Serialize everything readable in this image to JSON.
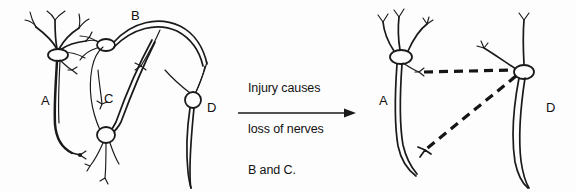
{
  "figure": {
    "title": "Injury causes loss of nerves B and C",
    "background_color": "#fdfdfd",
    "ink_color": "#1a1a1a"
  },
  "caption": {
    "line1": "Injury causes",
    "line2": "loss of nerves",
    "line3": "B and C."
  },
  "transition_arrow": {
    "direction": "right",
    "label": "transition-arrow"
  },
  "panels": [
    {
      "id": "before",
      "name": "intact-circuit",
      "neurons": [
        {
          "id": "A",
          "label": "A",
          "state": "intact"
        },
        {
          "id": "B",
          "label": "B",
          "state": "intact"
        },
        {
          "id": "C",
          "label": "C",
          "state": "intact"
        },
        {
          "id": "D",
          "label": "D",
          "state": "intact"
        }
      ]
    },
    {
      "id": "after",
      "name": "injured-circuit",
      "neurons": [
        {
          "id": "A",
          "label": "A",
          "state": "intact"
        },
        {
          "id": "D",
          "label": "D",
          "state": "intact"
        }
      ],
      "lost_neurons": [
        {
          "id": "B",
          "label": "B",
          "state": "lost"
        },
        {
          "id": "C",
          "label": "C",
          "state": "lost"
        }
      ],
      "dashed_paths": [
        {
          "name": "lost-nerve-path-upper",
          "from": "A",
          "to": "D"
        },
        {
          "name": "lost-nerve-path-lower",
          "from": "D",
          "to": "A-axon-terminal"
        }
      ]
    }
  ],
  "labels": {
    "left_A": "A",
    "left_B": "B",
    "left_C": "C",
    "left_D": "D",
    "right_A": "A",
    "right_D": "D"
  }
}
